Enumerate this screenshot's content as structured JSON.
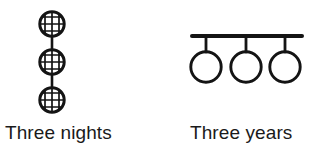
{
  "figure": {
    "background_color": "#ffffff",
    "ink_color": "#1a1a1a",
    "panels": [
      {
        "id": "three-nights",
        "caption": "Three nights",
        "glyph": {
          "name": "three-stacked-hatched-circles",
          "description": "Three cross-hatched (mesh) circles stacked vertically and joined by a short vertical connector line",
          "count": 3,
          "circle_fill": "none",
          "circle_stroke": "#141414",
          "circle_stroke_width": 3,
          "hatch_stroke": "#141414",
          "hatch_stroke_width": 1.6,
          "hatch_lines_horizontal": 3,
          "hatch_lines_vertical": 3,
          "circles": [
            {
              "cx": 26,
              "cy": 16,
              "r": 13
            },
            {
              "cx": 26,
              "cy": 54,
              "r": 13
            },
            {
              "cx": 26,
              "cy": 92,
              "r": 13
            }
          ],
          "connectors": [
            {
              "x1": 26,
              "y1": 29,
              "x2": 26,
              "y2": 41
            },
            {
              "x1": 26,
              "y1": 67,
              "x2": 26,
              "y2": 79
            }
          ]
        }
      },
      {
        "id": "three-years",
        "caption": "Three years",
        "glyph": {
          "name": "three-circles-hanging-from-bar",
          "description": "A horizontal bar with three open circles suspended beneath it by short vertical stems",
          "count": 3,
          "circle_fill": "none",
          "circle_stroke": "#141414",
          "circle_stroke_width": 3,
          "bar_stroke": "#141414",
          "bar_stroke_width": 4,
          "stem_stroke_width": 3,
          "bar": {
            "x1": 8,
            "y1": 10,
            "x2": 118,
            "y2": 10
          },
          "circles": [
            {
              "cx": 22,
              "cy": 41,
              "r": 16
            },
            {
              "cx": 62,
              "cy": 41,
              "r": 16
            },
            {
              "cx": 101,
              "cy": 41,
              "r": 16
            }
          ],
          "stems": [
            {
              "x1": 22,
              "y1": 10,
              "x2": 22,
              "y2": 25
            },
            {
              "x1": 62,
              "y1": 10,
              "x2": 62,
              "y2": 25
            },
            {
              "x1": 101,
              "y1": 10,
              "x2": 101,
              "y2": 25
            }
          ]
        }
      }
    ]
  }
}
